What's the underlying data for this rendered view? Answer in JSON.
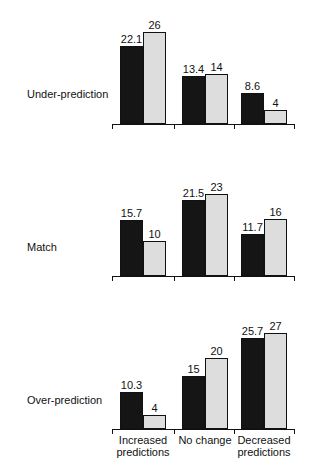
{
  "chart_data": {
    "type": "bar",
    "categories": [
      "Increased predictions",
      "No change",
      "Decreased predictions"
    ],
    "panels": [
      {
        "label": "Under-prediction",
        "series": [
          {
            "name": "dark",
            "values": [
              22.1,
              13.4,
              8.6
            ]
          },
          {
            "name": "stippled",
            "values": [
              26,
              14,
              4
            ]
          }
        ]
      },
      {
        "label": "Match",
        "series": [
          {
            "name": "dark",
            "values": [
              15.7,
              21.5,
              11.7
            ]
          },
          {
            "name": "stippled",
            "values": [
              10,
              23,
              16
            ]
          }
        ]
      },
      {
        "label": "Over-prediction",
        "series": [
          {
            "name": "dark",
            "values": [
              10.3,
              15,
              25.7
            ]
          },
          {
            "name": "stippled",
            "values": [
              4,
              20,
              27
            ]
          }
        ]
      }
    ],
    "value_labels": [
      [
        "22.1",
        "26",
        "13.4",
        "14",
        "8.6",
        "4"
      ],
      [
        "15.7",
        "10",
        "21.5",
        "23",
        "11.7",
        "16"
      ],
      [
        "10.3",
        "4",
        "15",
        "20",
        "25.7",
        "27"
      ]
    ],
    "xlabel_lines": [
      [
        "Increased",
        "predictions"
      ],
      [
        "No change",
        ""
      ],
      [
        "Decreased",
        "predictions"
      ]
    ],
    "title": "",
    "xlabel": "",
    "ylabel": "",
    "grid": false,
    "legend": "none"
  }
}
